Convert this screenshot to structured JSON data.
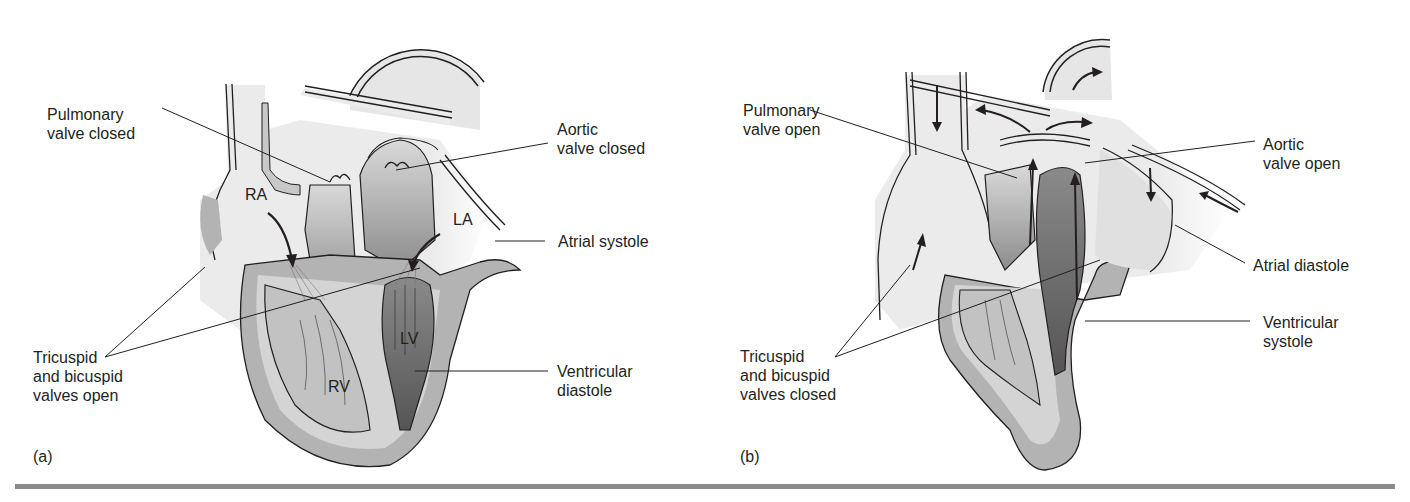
{
  "figure": {
    "panels": [
      {
        "id": "a",
        "letter": "(a)",
        "chambers": {
          "ra": "RA",
          "la": "LA",
          "rv": "RV",
          "lv": "LV"
        },
        "labels": {
          "pulmonary": [
            "Pulmonary",
            "valve closed"
          ],
          "aortic": [
            "Aortic",
            "valve closed"
          ],
          "atrial": [
            "Atrial systole"
          ],
          "av_valves": [
            "Tricuspid",
            "and bicuspid",
            "valves open"
          ],
          "ventricular": [
            "Ventricular",
            "diastole"
          ]
        }
      },
      {
        "id": "b",
        "letter": "(b)",
        "labels": {
          "pulmonary": [
            "Pulmonary",
            "valve open"
          ],
          "aortic": [
            "Aortic",
            "valve open"
          ],
          "atrial": [
            "Atrial diastole"
          ],
          "av_valves": [
            "Tricuspid",
            "and bicuspid",
            "valves closed"
          ],
          "ventricular": [
            "Ventricular",
            "systole"
          ]
        }
      }
    ],
    "colors": {
      "vessel_fill": "#ececec",
      "muscle_wall": "#b3b3b3",
      "ventricle_dark": "#6e6e6e",
      "chamber_mid": "#9a9a9a",
      "outline": "#231f20",
      "rule": "#8a8a8a"
    }
  }
}
